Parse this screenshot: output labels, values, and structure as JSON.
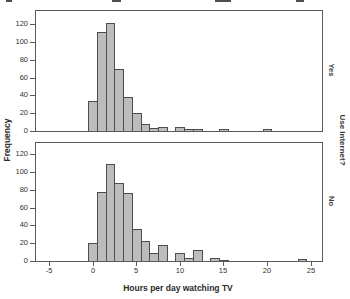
{
  "chart_data": {
    "type": "bar",
    "subtype": "paneled-histogram",
    "title": "",
    "xlabel": "Hours per day watching TV",
    "ylabel": "Frequency",
    "panel_dimension_label": "Use Internet?",
    "x_ticks": [
      -5,
      0,
      5,
      10,
      15,
      20,
      25
    ],
    "y_ticks": [
      0,
      20,
      40,
      60,
      80,
      100,
      120
    ],
    "xlim": [
      -6.6,
      26.3
    ],
    "ylim": [
      0,
      135
    ],
    "bin_width": 1,
    "grid": false,
    "legend": "none",
    "panels": [
      {
        "label": "Yes",
        "bins": [
          {
            "x": 0,
            "count": 34
          },
          {
            "x": 1,
            "count": 111
          },
          {
            "x": 2,
            "count": 121
          },
          {
            "x": 3,
            "count": 70
          },
          {
            "x": 4,
            "count": 38
          },
          {
            "x": 5,
            "count": 20
          },
          {
            "x": 6,
            "count": 8
          },
          {
            "x": 7,
            "count": 3
          },
          {
            "x": 8,
            "count": 5
          },
          {
            "x": 10,
            "count": 5
          },
          {
            "x": 11,
            "count": 2
          },
          {
            "x": 12,
            "count": 2
          },
          {
            "x": 15,
            "count": 2
          },
          {
            "x": 20,
            "count": 2
          }
        ]
      },
      {
        "label": "No",
        "bins": [
          {
            "x": 0,
            "count": 20
          },
          {
            "x": 1,
            "count": 77
          },
          {
            "x": 2,
            "count": 109
          },
          {
            "x": 3,
            "count": 88
          },
          {
            "x": 4,
            "count": 76
          },
          {
            "x": 5,
            "count": 36
          },
          {
            "x": 6,
            "count": 23
          },
          {
            "x": 7,
            "count": 9
          },
          {
            "x": 8,
            "count": 18
          },
          {
            "x": 10,
            "count": 9
          },
          {
            "x": 11,
            "count": 3
          },
          {
            "x": 12,
            "count": 12
          },
          {
            "x": 14,
            "count": 3
          },
          {
            "x": 15,
            "count": 1
          },
          {
            "x": 24,
            "count": 2
          }
        ]
      }
    ],
    "colors": {
      "bar_fill": "#bcbcbc",
      "bar_border": "#4d4d4d",
      "axis": "#5a5a5a",
      "text": "#2b2b2b",
      "background": "#ffffff"
    }
  }
}
